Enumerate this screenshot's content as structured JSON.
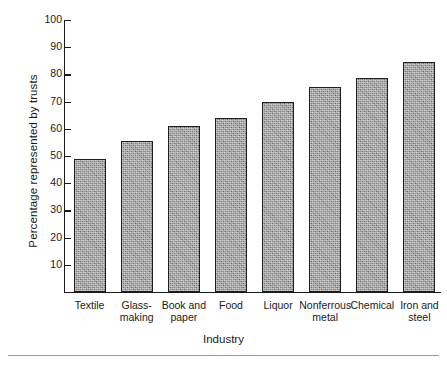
{
  "chart_data": {
    "type": "bar",
    "title": "",
    "xlabel": "Industry",
    "ylabel": "Percentage represented by trusts",
    "categories": [
      "Textile",
      "Glass-making",
      "Book and paper",
      "Food",
      "Liquor",
      "Nonferrous metal",
      "Chemical",
      "Iron and steel"
    ],
    "category_lines": [
      [
        "Textile"
      ],
      [
        "Glass-",
        "making"
      ],
      [
        "Book and",
        "paper"
      ],
      [
        "Food"
      ],
      [
        "Liquor"
      ],
      [
        "Nonferrous",
        "metal"
      ],
      [
        "Chemical"
      ],
      [
        "Iron and",
        "steel"
      ]
    ],
    "values": [
      49,
      55.5,
      61,
      64,
      70,
      75.5,
      78.5,
      84.5
    ],
    "ylim": [
      0,
      100
    ],
    "yticks": [
      10,
      20,
      30,
      40,
      50,
      60,
      70,
      80,
      90,
      100
    ],
    "ytick_labels": [
      "10",
      "20",
      "30",
      "40",
      "50",
      "60",
      "70",
      "80",
      "90",
      "100"
    ],
    "grid": false,
    "legend": null,
    "bar_fill_color": "#8d8d8d",
    "bar_edge_color": "#1f1f1f",
    "axis_color": "#1a1a1a",
    "background_color": "#ffffff"
  }
}
